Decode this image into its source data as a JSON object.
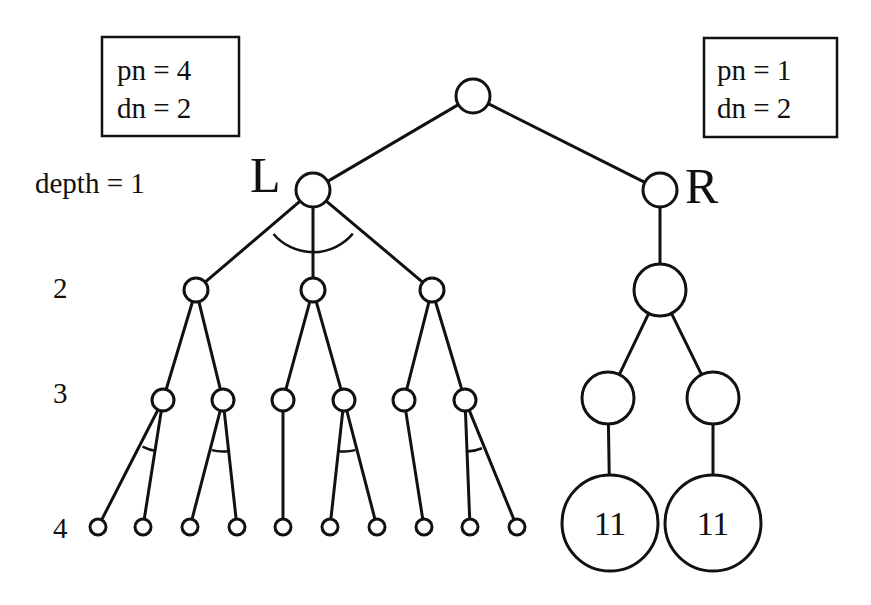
{
  "diagram": {
    "left_box": {
      "line1": "pn = 4",
      "line2": "dn = 2"
    },
    "right_box": {
      "line1": "pn = 1",
      "line2": "dn = 2"
    },
    "node_labels": {
      "left": "L",
      "right": "R"
    },
    "depth_labels": [
      {
        "text": "depth = 1",
        "x": 35,
        "y": 193
      },
      {
        "text": "2",
        "x": 53,
        "y": 298
      },
      {
        "text": "3",
        "x": 53,
        "y": 403
      },
      {
        "text": "4",
        "x": 53,
        "y": 538
      }
    ],
    "leaf_values": {
      "r_leaf_left": "11",
      "r_leaf_right": "11"
    },
    "colors": {
      "stroke": "#111111",
      "background": "#ffffff"
    }
  },
  "nodes": [
    {
      "id": "root",
      "x": 473,
      "y": 96,
      "r": 17
    },
    {
      "id": "L",
      "x": 313,
      "y": 190,
      "r": 17
    },
    {
      "id": "R",
      "x": 660,
      "y": 190,
      "r": 17
    },
    {
      "id": "L2a",
      "x": 196,
      "y": 290,
      "r": 12
    },
    {
      "id": "L2b",
      "x": 313,
      "y": 290,
      "r": 12
    },
    {
      "id": "L2c",
      "x": 432,
      "y": 290,
      "r": 12
    },
    {
      "id": "R2",
      "x": 660,
      "y": 290,
      "r": 26
    },
    {
      "id": "L3a",
      "x": 163,
      "y": 400,
      "r": 11
    },
    {
      "id": "L3b",
      "x": 223,
      "y": 400,
      "r": 11
    },
    {
      "id": "L3c",
      "x": 283,
      "y": 400,
      "r": 11
    },
    {
      "id": "L3d",
      "x": 344,
      "y": 400,
      "r": 11
    },
    {
      "id": "L3e",
      "x": 404,
      "y": 400,
      "r": 11
    },
    {
      "id": "L3f",
      "x": 465,
      "y": 400,
      "r": 11
    },
    {
      "id": "R3a",
      "x": 608,
      "y": 398,
      "r": 26
    },
    {
      "id": "R3b",
      "x": 713,
      "y": 398,
      "r": 26
    },
    {
      "id": "L4a",
      "x": 98,
      "y": 527,
      "r": 8
    },
    {
      "id": "L4b",
      "x": 143,
      "y": 527,
      "r": 8
    },
    {
      "id": "L4c",
      "x": 190,
      "y": 527,
      "r": 8
    },
    {
      "id": "L4d",
      "x": 237,
      "y": 527,
      "r": 8
    },
    {
      "id": "L4e",
      "x": 283,
      "y": 527,
      "r": 8
    },
    {
      "id": "L4f",
      "x": 330,
      "y": 527,
      "r": 8
    },
    {
      "id": "L4g",
      "x": 377,
      "y": 527,
      "r": 8
    },
    {
      "id": "L4h",
      "x": 424,
      "y": 527,
      "r": 8
    },
    {
      "id": "L4i",
      "x": 470,
      "y": 527,
      "r": 8
    },
    {
      "id": "L4j",
      "x": 517,
      "y": 527,
      "r": 8
    },
    {
      "id": "R4a",
      "x": 610,
      "y": 523,
      "r": 48,
      "label": "11"
    },
    {
      "id": "R4b",
      "x": 713,
      "y": 523,
      "r": 48,
      "label": "11"
    }
  ],
  "edges": [
    [
      "root",
      "L"
    ],
    [
      "root",
      "R"
    ],
    [
      "L",
      "L2a"
    ],
    [
      "L",
      "L2b"
    ],
    [
      "L",
      "L2c"
    ],
    [
      "R",
      "R2"
    ],
    [
      "L2a",
      "L3a"
    ],
    [
      "L2a",
      "L3b"
    ],
    [
      "L2b",
      "L3c"
    ],
    [
      "L2b",
      "L3d"
    ],
    [
      "L2c",
      "L3e"
    ],
    [
      "L2c",
      "L3f"
    ],
    [
      "R2",
      "R3a"
    ],
    [
      "R2",
      "R3b"
    ],
    [
      "L3a",
      "L4a"
    ],
    [
      "L3a",
      "L4b"
    ],
    [
      "L3b",
      "L4c"
    ],
    [
      "L3b",
      "L4d"
    ],
    [
      "L3c",
      "L4e"
    ],
    [
      "L3d",
      "L4f"
    ],
    [
      "L3d",
      "L4g"
    ],
    [
      "L3e",
      "L4h"
    ],
    [
      "L3f",
      "L4i"
    ],
    [
      "L3f",
      "L4j"
    ],
    [
      "R3a",
      "R4a"
    ],
    [
      "R3b",
      "R4b"
    ]
  ],
  "and_arcs": [
    {
      "parent": "L",
      "children": [
        "L2a",
        "L2c"
      ],
      "radius": 52
    },
    {
      "parent": "L3a",
      "children": [
        "L4a",
        "L4b"
      ],
      "radius": 45
    },
    {
      "parent": "L3b",
      "children": [
        "L4c",
        "L4d"
      ],
      "radius": 45
    },
    {
      "parent": "L3d",
      "children": [
        "L4f",
        "L4g"
      ],
      "radius": 45
    },
    {
      "parent": "L3f",
      "children": [
        "L4i",
        "L4j"
      ],
      "radius": 45
    }
  ]
}
